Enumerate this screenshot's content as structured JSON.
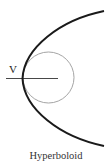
{
  "diagram": {
    "title": "Hyperboloid",
    "vertex_label": "V",
    "colors": {
      "curve": "#1a1a1a",
      "circle": "#9a9a9a",
      "axis": "#333333",
      "background": "#ffffff"
    }
  }
}
